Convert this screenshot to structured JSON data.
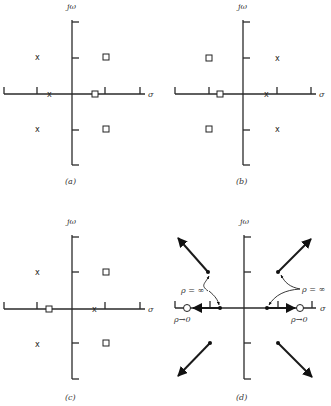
{
  "figure": {
    "axis_labels": {
      "imag": "jω",
      "real": "σ"
    },
    "panels": [
      {
        "id": "a",
        "caption": "(a)"
      },
      {
        "id": "b",
        "caption": "(b)"
      },
      {
        "id": "c",
        "caption": "(c)"
      },
      {
        "id": "d",
        "caption": "(d)"
      }
    ],
    "markers": {
      "pole": "x",
      "zero": "square"
    },
    "annotations": {
      "gain_inf_left": "ρ = ∞",
      "gain_inf_right": "ρ = ∞",
      "gain_zero_left": "ρ→0",
      "gain_zero_right": "ρ→0"
    }
  }
}
